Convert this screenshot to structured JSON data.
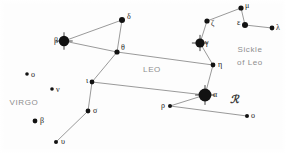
{
  "chart_data": {
    "type": "scatter",
    "title": "",
    "subtitle": "",
    "xlabel": "",
    "ylabel": "",
    "xlim": [
      0,
      286
    ],
    "ylim": [
      0,
      153
    ],
    "grid": false,
    "legend": "none",
    "star_color": "#121212",
    "line_color": "#6f6f6f",
    "label_color": "#1b1b1b",
    "region_label_color": "#8d8d8d",
    "background_color": "#fdfdfd",
    "stars": [
      {
        "id": "leo-beta",
        "label": "β",
        "x": 64,
        "y": 41,
        "r": 5.2,
        "label_dx": -10,
        "label_dy": -4,
        "cross": true,
        "constellation": "Leo"
      },
      {
        "id": "leo-delta",
        "label": "δ",
        "x": 122,
        "y": 20,
        "r": 3.0,
        "label_dx": 5,
        "label_dy": -7,
        "cross": false,
        "constellation": "Leo"
      },
      {
        "id": "leo-theta",
        "label": "θ",
        "x": 117,
        "y": 52,
        "r": 2.6,
        "label_dx": 4,
        "label_dy": -8,
        "cross": false,
        "constellation": "Leo"
      },
      {
        "id": "leo-eta",
        "label": "η",
        "x": 213,
        "y": 65,
        "r": 2.4,
        "label_dx": 5,
        "label_dy": -4,
        "cross": false,
        "constellation": "Leo"
      },
      {
        "id": "leo-gamma",
        "label": "γ",
        "x": 200,
        "y": 43,
        "r": 4.6,
        "label_dx": 5,
        "label_dy": -4,
        "cross": true,
        "constellation": "Leo"
      },
      {
        "id": "leo-zeta",
        "label": "ζ",
        "x": 207,
        "y": 21,
        "r": 2.6,
        "label_dx": 4,
        "label_dy": -1,
        "cross": false,
        "constellation": "Leo"
      },
      {
        "id": "leo-mu",
        "label": "μ",
        "x": 241,
        "y": 8,
        "r": 2.6,
        "label_dx": 4,
        "label_dy": -6,
        "cross": false,
        "constellation": "Leo"
      },
      {
        "id": "leo-epsilon",
        "label": "ε",
        "x": 245,
        "y": 25,
        "r": 3.0,
        "label_dx": -8,
        "label_dy": -6,
        "cross": false,
        "constellation": "Leo"
      },
      {
        "id": "leo-lambda",
        "label": "λ",
        "x": 272,
        "y": 28,
        "r": 2.4,
        "label_dx": 4,
        "label_dy": -4,
        "cross": false,
        "constellation": "Leo"
      },
      {
        "id": "leo-alpha",
        "label": "α",
        "x": 205,
        "y": 95,
        "r": 6.4,
        "label_dx": 8,
        "label_dy": -4,
        "cross": true,
        "constellation": "Leo"
      },
      {
        "id": "leo-rho",
        "label": "ρ",
        "x": 170,
        "y": 106,
        "r": 2.0,
        "label_dx": -9,
        "label_dy": -4,
        "cross": false,
        "constellation": "Leo"
      },
      {
        "id": "leo-omicron",
        "label": "o",
        "x": 247,
        "y": 116,
        "r": 2.0,
        "label_dx": 4,
        "label_dy": -4,
        "cross": false,
        "constellation": "Leo"
      },
      {
        "id": "leo-iota",
        "label": "ι",
        "x": 92,
        "y": 82,
        "r": 2.4,
        "label_dx": -6,
        "label_dy": -5,
        "cross": false,
        "constellation": "Leo"
      },
      {
        "id": "leo-sigma",
        "label": "σ",
        "x": 88,
        "y": 111,
        "r": 2.4,
        "label_dx": 5,
        "label_dy": -4,
        "cross": false,
        "constellation": "Leo"
      },
      {
        "id": "leo-upsilon",
        "label": "υ",
        "x": 56,
        "y": 142,
        "r": 2.0,
        "label_dx": 5,
        "label_dy": -4,
        "cross": false,
        "constellation": "Leo"
      },
      {
        "id": "virgo-omicron",
        "label": "o",
        "x": 27,
        "y": 74,
        "r": 1.8,
        "label_dx": 4,
        "label_dy": -3,
        "cross": false,
        "constellation": "Virgo"
      },
      {
        "id": "virgo-nu",
        "label": "ν",
        "x": 52,
        "y": 89,
        "r": 1.8,
        "label_dx": 4,
        "label_dy": -3,
        "cross": false,
        "constellation": "Virgo"
      },
      {
        "id": "virgo-beta",
        "label": "β",
        "x": 35,
        "y": 121,
        "r": 2.4,
        "label_dx": 5,
        "label_dy": -4,
        "cross": false,
        "constellation": "Virgo"
      }
    ],
    "lines": [
      {
        "id": "beta-delta",
        "from": "leo-beta",
        "to": "leo-delta"
      },
      {
        "id": "beta-theta",
        "from": "leo-beta",
        "to": "leo-theta"
      },
      {
        "id": "delta-theta",
        "from": "leo-delta",
        "to": "leo-theta"
      },
      {
        "id": "theta-eta",
        "from": "leo-theta",
        "to": "leo-eta"
      },
      {
        "id": "theta-iota",
        "from": "leo-theta",
        "to": "leo-iota"
      },
      {
        "id": "eta-gamma",
        "from": "leo-eta",
        "to": "leo-gamma"
      },
      {
        "id": "eta-alpha",
        "from": "leo-eta",
        "to": "leo-alpha"
      },
      {
        "id": "gamma-zeta",
        "from": "leo-gamma",
        "to": "leo-zeta"
      },
      {
        "id": "zeta-mu",
        "from": "leo-zeta",
        "to": "leo-mu"
      },
      {
        "id": "mu-epsilon",
        "from": "leo-mu",
        "to": "leo-epsilon"
      },
      {
        "id": "epsilon-lambda",
        "from": "leo-epsilon",
        "to": "leo-lambda"
      },
      {
        "id": "iota-alpha",
        "from": "leo-iota",
        "to": "leo-alpha"
      },
      {
        "id": "iota-sigma",
        "from": "leo-iota",
        "to": "leo-sigma"
      },
      {
        "id": "sigma-upsilon",
        "from": "leo-sigma",
        "to": "leo-upsilon"
      },
      {
        "id": "alpha-rho",
        "from": "leo-alpha",
        "to": "leo-rho"
      },
      {
        "id": "rho-omicron",
        "from": "leo-rho",
        "to": "leo-omicron"
      }
    ],
    "annotations": [
      {
        "id": "leo-name",
        "text": "LEO",
        "x": 152,
        "y": 70,
        "kind": "region"
      },
      {
        "id": "virgo-name",
        "text": "VIRGO",
        "x": 24,
        "y": 103,
        "kind": "region"
      },
      {
        "id": "sickle-line-1",
        "text": "Sickle",
        "x": 250,
        "y": 50,
        "kind": "region"
      },
      {
        "id": "sickle-line-2",
        "text": "of Leo",
        "x": 250,
        "y": 63,
        "kind": "region"
      },
      {
        "id": "leo-symbol",
        "text": "ℛ",
        "x": 234,
        "y": 99,
        "kind": "symbol"
      }
    ]
  }
}
